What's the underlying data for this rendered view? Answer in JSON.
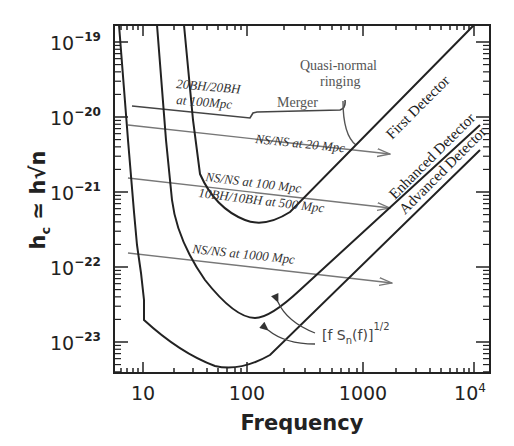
{
  "chart_data": {
    "type": "line",
    "title": "",
    "xlabel": "Frequency",
    "ylabel": "h_c ≃ h√n",
    "xscale": "log",
    "yscale": "log",
    "xlim": [
      7,
      11000
    ],
    "ylim": [
      5e-24,
      1.6e-19
    ],
    "xticks": [
      "10",
      "100",
      "1000",
      "10^4"
    ],
    "yticks": [
      "10^-19",
      "10^-20",
      "10^-21",
      "10^-22",
      "10^-23"
    ],
    "grid": false,
    "series": [
      {
        "name": "First Detector",
        "style": "solid-black",
        "x": [
          12,
          20,
          30,
          40,
          60,
          100,
          150,
          200,
          300,
          500,
          1000,
          3000,
          10000
        ],
        "y": [
          1.6e-19,
          1e-20,
          2e-21,
          8e-22,
          4.5e-22,
          3.5e-22,
          4e-22,
          5e-22,
          7.5e-22,
          1.2e-21,
          2.4e-21,
          7e-21,
          2.4e-20
        ]
      },
      {
        "name": "Enhanced Detector",
        "style": "solid-black",
        "x": [
          17,
          25,
          40,
          60,
          100,
          150,
          200,
          300,
          500,
          1000,
          3000,
          10000
        ],
        "y": [
          1.6e-19,
          4e-21,
          4e-22,
          1.4e-22,
          4.5e-23,
          3e-23,
          3.5e-23,
          5e-23,
          9e-23,
          1.8e-22,
          5.5e-22,
          1.8e-21
        ]
      },
      {
        "name": "Advanced Detector",
        "style": "solid-black",
        "x": [
          8,
          10,
          10.5,
          15,
          20,
          30,
          50,
          70,
          100,
          200,
          500,
          1000,
          3000,
          10000
        ],
        "y": [
          1.6e-19,
          2e-22,
          5e-23,
          2.5e-23,
          1.5e-23,
          9e-24,
          6e-24,
          6.5e-24,
          1e-23,
          2.3e-23,
          5.5e-23,
          1.1e-22,
          3.3e-22,
          1.1e-21
        ]
      },
      {
        "name": "20BH/20BH at 100Mpc",
        "style": "dark-gray",
        "x": [
          8,
          30,
          70,
          100,
          200,
          500,
          700
        ],
        "y": [
          1.2e-20,
          1e-20,
          8.8e-21,
          1e-20,
          1e-20,
          1e-20,
          1.05e-20
        ]
      },
      {
        "name": "NS/NS at 20 Mpc",
        "style": "gray-arrow",
        "x": [
          8,
          1800
        ],
        "y": [
          7.5e-21,
          2.5e-21
        ]
      },
      {
        "name": "NS/NS at 100 Mpc",
        "style": "gray-arrow",
        "x": [
          8,
          1800
        ],
        "y": [
          1.3e-21,
          4.5e-22
        ]
      },
      {
        "name": "10BH/10BH at 500 Mpc",
        "style": "gray-arrow",
        "x": [
          300,
          1800
        ],
        "y": [
          7e-22,
          5e-22
        ]
      },
      {
        "name": "NS/NS at 1000 Mpc",
        "style": "gray-arrow",
        "x": [
          8,
          1800
        ],
        "y": [
          1.6e-22,
          5e-23
        ]
      }
    ],
    "annotations": [
      "20BH/20BH at 100Mpc",
      "Merger",
      "Quasi-normal ringing",
      "NS/NS at 20 Mpc",
      "NS/NS at 100 Mpc",
      "10BH/10BH at 500 Mpc",
      "NS/NS at 1000 Mpc",
      "First Detector",
      "Enhanced Detector",
      "Advanced Detector",
      "[f S_n(f)]^1/2"
    ]
  },
  "labels": {
    "x_ticks": [
      "10",
      "100",
      "1000",
      "10"
    ],
    "x_tick_last_exp": "4",
    "y_base": "10",
    "y_exps": [
      "−19",
      "−20",
      "−21",
      "−22",
      "−23"
    ],
    "xlabel": "Frequency",
    "ylabel_main": "h",
    "ylabel_sub": "c",
    "ylabel_rest": " ≃ h√n",
    "bh20": "20BH/20BH",
    "bh20b": "at 100Mpc",
    "merger": "Merger",
    "qnr1": "Quasi-normal",
    "qnr2": "ringing",
    "ns20": "NS/NS at 20 Mpc",
    "ns100": "NS/NS at 100 Mpc",
    "bh10": "10BH/10BH at 500 Mpc",
    "ns1000": "NS/NS at 1000 Mpc",
    "first": "First Detector",
    "enhanced": "Enhanced Detector",
    "advanced": "Advanced Detector",
    "formula_main": "[f S",
    "formula_sub": "n",
    "formula_end": "(f)]",
    "formula_sup": "1/2"
  }
}
